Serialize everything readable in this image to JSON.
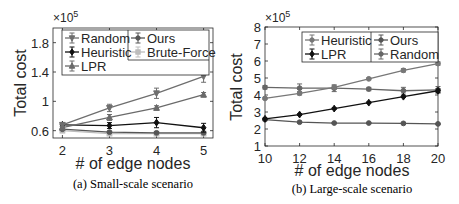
{
  "chart_data": [
    {
      "type": "line",
      "caption": "(a) Small-scale scenario",
      "xlabel": "# of edge nodes",
      "ylabel": "Total cost",
      "y_multiplier": "×10^5",
      "x": [
        2,
        3,
        4,
        5
      ],
      "xticks": [
        "2",
        "3",
        "4",
        "5"
      ],
      "yticks": [
        "0.6",
        "1",
        "1.4",
        "1.8"
      ],
      "ylim": [
        0.5,
        2.0
      ],
      "xlim": [
        1.8,
        5.2
      ],
      "grid": false,
      "legend_position": "upper left (two columns)",
      "series": [
        {
          "name": "Random",
          "values": [
            0.68,
            0.91,
            1.11,
            1.34
          ],
          "error": [
            0.02,
            0.05,
            0.07,
            0.08
          ],
          "color": "#6e6e6e",
          "marker": "triangle-down"
        },
        {
          "name": "Heuristic",
          "values": [
            0.68,
            0.67,
            0.71,
            0.64
          ],
          "error": [
            0.02,
            0.04,
            0.07,
            0.06
          ],
          "color": "#111111",
          "marker": "diamond"
        },
        {
          "name": "LPR",
          "values": [
            0.64,
            0.78,
            0.91,
            1.09
          ],
          "error": [
            0.02,
            0.04,
            0.03,
            0.03
          ],
          "color": "#6a6a6a",
          "marker": "triangle-up"
        },
        {
          "name": "Ours",
          "values": [
            0.62,
            0.58,
            0.57,
            0.57
          ],
          "error": [
            0.01,
            0.01,
            0.01,
            0.01
          ],
          "color": "#555555",
          "marker": "circle"
        },
        {
          "name": "Brute-Force",
          "values": [
            0.6,
            0.56,
            0.56,
            0.56
          ],
          "error": [
            0.01,
            0.01,
            0.01,
            0.01
          ],
          "color": "#bdbdbd",
          "marker": "square"
        }
      ]
    },
    {
      "type": "line",
      "caption": "(b) Large-scale scenario",
      "xlabel": "# of edge nodes",
      "ylabel": "Total cost",
      "y_multiplier": "×10^5",
      "x": [
        10,
        12,
        14,
        16,
        18,
        20
      ],
      "xticks": [
        "10",
        "12",
        "14",
        "16",
        "18",
        "20"
      ],
      "yticks": [
        "1",
        "2",
        "3",
        "4",
        "5",
        "6",
        "7",
        "8"
      ],
      "ylim": [
        1,
        8
      ],
      "xlim": [
        10,
        20
      ],
      "grid": false,
      "legend_position": "upper right (two columns)",
      "series": [
        {
          "name": "Heuristic",
          "values": [
            3.8,
            4.1,
            4.45,
            4.95,
            5.45,
            5.85
          ],
          "error": [
            0.05,
            0.1,
            0.1,
            0.05,
            0.1,
            0.1
          ],
          "color": "#777777",
          "marker": "circle"
        },
        {
          "name": "LPR",
          "values": [
            2.6,
            2.85,
            3.2,
            3.55,
            3.9,
            4.25
          ],
          "error": [
            0.05,
            0.05,
            0.05,
            0.05,
            0.05,
            0.1
          ],
          "color": "#111111",
          "marker": "diamond"
        },
        {
          "name": "Ours",
          "values": [
            2.55,
            2.4,
            2.35,
            2.35,
            2.33,
            2.3
          ],
          "error": [
            0.03,
            0.03,
            0.03,
            0.03,
            0.03,
            0.03
          ],
          "color": "#555555",
          "marker": "circle"
        },
        {
          "name": "Random",
          "values": [
            4.45,
            4.4,
            4.4,
            4.35,
            4.25,
            4.3
          ],
          "error": [
            0.1,
            0.25,
            0.2,
            0.1,
            0.2,
            0.2
          ],
          "color": "#666666",
          "marker": "circle"
        }
      ]
    }
  ],
  "labels": {
    "left": {
      "caption": "(a) Small-scale scenario",
      "xlabel": "# of edge nodes",
      "ylabel": "Total cost",
      "exp_base": "×10",
      "exp_pow": "5"
    },
    "right": {
      "caption": "(b) Large-scale scenario",
      "xlabel": "# of edge nodes",
      "ylabel": "Total cost",
      "exp_base": "×10",
      "exp_pow": "5"
    }
  }
}
